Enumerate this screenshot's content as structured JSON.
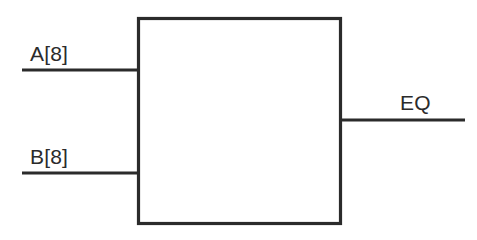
{
  "diagram": {
    "type": "logic-block-diagram",
    "background_color": "#ffffff",
    "stroke_color": "#2b2b2b",
    "block": {
      "label": "",
      "fill_color": "#ffffff",
      "x": 137,
      "y": 17,
      "width": 205,
      "height": 208
    },
    "inputs": [
      {
        "name": "A",
        "label": "A[8]",
        "width_bits": 8,
        "side": "left",
        "wire_y": 70,
        "wire_x_start": 22,
        "wire_x_end": 140
      },
      {
        "name": "B",
        "label": "B[8]",
        "width_bits": 8,
        "side": "left",
        "wire_y": 173,
        "wire_x_start": 22,
        "wire_x_end": 140
      }
    ],
    "outputs": [
      {
        "name": "EQ",
        "label": "EQ",
        "width_bits": 1,
        "side": "right",
        "wire_y": 120,
        "wire_x_start": 340,
        "wire_x_end": 465
      }
    ]
  }
}
